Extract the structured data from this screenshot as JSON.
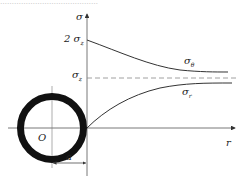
{
  "caption_fragment": "……………………………………",
  "axes": {
    "y_label": "σ",
    "x_label": "r",
    "origin_label": "O"
  },
  "ticks": {
    "two_sigma_z": {
      "coef": "2",
      "sym": "σ",
      "sub": "z"
    },
    "sigma_z": {
      "sym": "σ",
      "sub": "z"
    }
  },
  "curves": {
    "theta": {
      "sym": "σ",
      "sub": "θ"
    },
    "r": {
      "sym": "σ",
      "sub": "r"
    }
  },
  "dimension": {
    "label": "a"
  },
  "colors": {
    "line": "#333333",
    "ring": "#111111",
    "dashed": "#888888"
  }
}
